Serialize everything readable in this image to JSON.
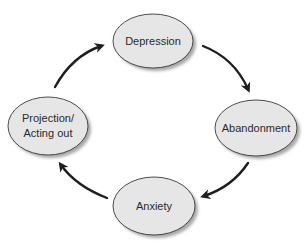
{
  "diagram": {
    "type": "cycle",
    "colors": {
      "node_fill": "#e6e6e6",
      "node_stroke": "#3a3a3a",
      "node_shadow": "#a8a8a8",
      "arrow": "#1e1e1e",
      "text": "#2a2a2a"
    },
    "nodes": [
      {
        "id": "depression",
        "label_lines": [
          "Depression"
        ],
        "cx": 153,
        "cy": 41,
        "rx": 40,
        "ry": 27
      },
      {
        "id": "abandonment",
        "label_lines": [
          "Abandonment"
        ],
        "cx": 256,
        "cy": 128,
        "rx": 41,
        "ry": 28
      },
      {
        "id": "anxiety",
        "label_lines": [
          "Anxiety"
        ],
        "cx": 154,
        "cy": 206,
        "rx": 41,
        "ry": 29
      },
      {
        "id": "projection",
        "label_lines": [
          "Projection/",
          "Acting out"
        ],
        "cx": 48,
        "cy": 126,
        "rx": 40,
        "ry": 29
      }
    ],
    "edges": [
      {
        "from": "depression",
        "to": "abandonment"
      },
      {
        "from": "abandonment",
        "to": "anxiety"
      },
      {
        "from": "anxiety",
        "to": "projection"
      },
      {
        "from": "projection",
        "to": "depression"
      }
    ]
  }
}
